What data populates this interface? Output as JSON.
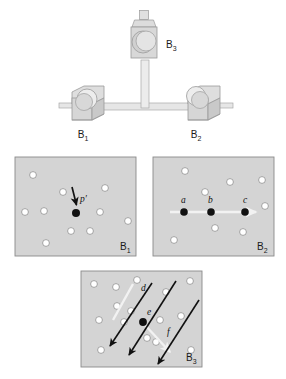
{
  "figure": {
    "background_color": "#ffffff",
    "panel_fill": "#d4d4d4",
    "panel_stroke": "#8a8a8a",
    "dot_open_fill": "#ffffff",
    "dot_open_stroke": "#8f8f8f",
    "dot_filled_fill": "#111111",
    "arrow_dark_color": "#111111",
    "arrow_light_color": "#f2f2f2",
    "apparatus_fill": "#d8d8d8",
    "apparatus_stroke": "#9a9a9a",
    "apparatus_rod_fill": "#e8e8e8"
  },
  "apparatus": {
    "name": "three-camera-rig",
    "labels": [
      {
        "id": "b3",
        "base": "B",
        "sub": "3",
        "x": 166,
        "y": 48
      },
      {
        "id": "b1",
        "base": "B",
        "sub": "1",
        "x": 83,
        "y": 138
      },
      {
        "id": "b2",
        "base": "B",
        "sub": "2",
        "x": 196,
        "y": 138
      }
    ]
  },
  "panels": [
    {
      "id": "panel-b1",
      "label_base": "B",
      "label_sub": "1",
      "label_x": 126,
      "label_y": 250,
      "rect": {
        "x": 15,
        "y": 157,
        "w": 121,
        "h": 99
      },
      "open_dots": [
        {
          "x": 33,
          "y": 175
        },
        {
          "x": 63,
          "y": 192
        },
        {
          "x": 44,
          "y": 211
        },
        {
          "x": 75,
          "y": 212
        },
        {
          "x": 25,
          "y": 212
        },
        {
          "x": 105,
          "y": 188
        },
        {
          "x": 100,
          "y": 212
        },
        {
          "x": 128,
          "y": 221
        },
        {
          "x": 71,
          "y": 231
        },
        {
          "x": 90,
          "y": 231
        },
        {
          "x": 46,
          "y": 243
        }
      ],
      "filled_dots": [
        {
          "id": "p-prime",
          "x": 76,
          "y": 213,
          "r": 4.0
        }
      ],
      "arrows": [
        {
          "id": "arrow-p-prime",
          "x1": 72,
          "y1": 187,
          "x2": 76,
          "y2": 206,
          "color": "dark",
          "width": 1.6
        }
      ],
      "point_labels": [
        {
          "text": "p′",
          "x": 80,
          "y": 200
        }
      ]
    },
    {
      "id": "panel-b2",
      "label_base": "B",
      "label_sub": "2",
      "label_x": 263,
      "label_y": 250,
      "rect": {
        "x": 153,
        "y": 157,
        "w": 121,
        "h": 99
      },
      "open_dots": [
        {
          "x": 185,
          "y": 171
        },
        {
          "x": 205,
          "y": 192
        },
        {
          "x": 230,
          "y": 182
        },
        {
          "x": 262,
          "y": 180
        },
        {
          "x": 265,
          "y": 206
        },
        {
          "x": 215,
          "y": 228
        },
        {
          "x": 243,
          "y": 232
        },
        {
          "x": 174,
          "y": 240
        }
      ],
      "filled_dots": [
        {
          "id": "a",
          "x": 184,
          "y": 212,
          "r": 3.8
        },
        {
          "id": "b",
          "x": 211,
          "y": 212,
          "r": 3.8
        },
        {
          "id": "c",
          "x": 245,
          "y": 212,
          "r": 3.8
        }
      ],
      "arrows": [
        {
          "id": "arrow-abc",
          "x1": 171,
          "y1": 212,
          "x2": 259,
          "y2": 212,
          "color": "light",
          "width": 2.6
        }
      ],
      "point_labels": [
        {
          "text": "a",
          "x": 181,
          "y": 202
        },
        {
          "text": "b",
          "x": 208,
          "y": 202
        },
        {
          "text": "c",
          "x": 244,
          "y": 202
        }
      ]
    },
    {
      "id": "panel-b3",
      "label_base": "B",
      "label_sub": "3",
      "label_x": 194,
      "label_y": 362,
      "rect": {
        "x": 81,
        "y": 271,
        "w": 121,
        "h": 96
      },
      "open_dots": [
        {
          "x": 94,
          "y": 284
        },
        {
          "x": 116,
          "y": 287
        },
        {
          "x": 137,
          "y": 280
        },
        {
          "x": 190,
          "y": 281
        },
        {
          "x": 117,
          "y": 306
        },
        {
          "x": 166,
          "y": 292
        },
        {
          "x": 99,
          "y": 320
        },
        {
          "x": 131,
          "y": 311
        },
        {
          "x": 124,
          "y": 322
        },
        {
          "x": 150,
          "y": 318
        },
        {
          "x": 178,
          "y": 315
        },
        {
          "x": 147,
          "y": 338
        },
        {
          "x": 101,
          "y": 350
        },
        {
          "x": 191,
          "y": 350
        }
      ],
      "filled_dots": [
        {
          "id": "e",
          "x": 143,
          "y": 322,
          "r": 3.8
        }
      ],
      "arrows": [
        {
          "id": "arrow-d-light",
          "x1": 133,
          "y1": 284,
          "x2": 112,
          "y2": 322,
          "color": "light",
          "width": 2.4
        },
        {
          "id": "arrow-d-dark",
          "x1": 152,
          "y1": 283,
          "x2": 108,
          "y2": 349,
          "color": "dark",
          "width": 1.6
        },
        {
          "id": "arrow-e-dark",
          "x1": 176,
          "y1": 281,
          "x2": 127,
          "y2": 358,
          "color": "dark",
          "width": 1.6
        },
        {
          "id": "arrow-f-light",
          "x1": 143,
          "y1": 322,
          "x2": 172,
          "y2": 355,
          "color": "light",
          "width": 2.4
        },
        {
          "id": "arrow-f-dark",
          "x1": 199,
          "y1": 300,
          "x2": 156,
          "y2": 367,
          "color": "dark",
          "width": 1.6
        }
      ],
      "point_labels": [
        {
          "text": "d",
          "x": 142,
          "y": 290
        },
        {
          "text": "e",
          "x": 148,
          "y": 313
        },
        {
          "text": "f",
          "x": 168,
          "y": 334
        }
      ]
    }
  ]
}
